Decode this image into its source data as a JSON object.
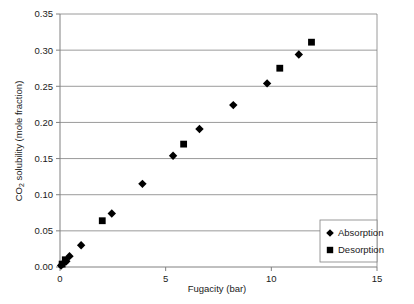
{
  "chart_data": {
    "type": "scatter",
    "title": "",
    "xlabel": "Fugacity (bar)",
    "ylabel": "CO2 solubility (mole fraction)",
    "ylabel_prefix": "CO",
    "ylabel_subscript": "2",
    "ylabel_suffix": " solubility (mole fraction)",
    "xlim": [
      0,
      15
    ],
    "ylim": [
      0,
      0.35
    ],
    "xticks": [
      0,
      5,
      10,
      15
    ],
    "xtick_labels": [
      "0",
      "5",
      "10",
      "15"
    ],
    "yticks": [
      0.0,
      0.05,
      0.1,
      0.15,
      0.2,
      0.25,
      0.3,
      0.35
    ],
    "ytick_labels": [
      "0.00",
      "0.05",
      "0.10",
      "0.15",
      "0.20",
      "0.25",
      "0.30",
      "0.35"
    ],
    "grid": "horizontal",
    "legend_position": "bottom-right",
    "marker_color": "#000000",
    "axis_color": "#808080",
    "grid_color": "#808080",
    "series": [
      {
        "name": "Absorption",
        "marker": "diamond",
        "color": "#000000",
        "points": [
          {
            "x": 0.05,
            "y": 0.002
          },
          {
            "x": 0.15,
            "y": 0.005
          },
          {
            "x": 0.3,
            "y": 0.008
          },
          {
            "x": 0.45,
            "y": 0.015
          },
          {
            "x": 1.0,
            "y": 0.03
          },
          {
            "x": 2.45,
            "y": 0.074
          },
          {
            "x": 3.9,
            "y": 0.115
          },
          {
            "x": 5.35,
            "y": 0.154
          },
          {
            "x": 6.6,
            "y": 0.191
          },
          {
            "x": 8.2,
            "y": 0.224
          },
          {
            "x": 9.8,
            "y": 0.254
          },
          {
            "x": 11.3,
            "y": 0.294
          }
        ]
      },
      {
        "name": "Desorption",
        "marker": "square",
        "color": "#000000",
        "points": [
          {
            "x": 0.1,
            "y": 0.004
          },
          {
            "x": 0.25,
            "y": 0.01
          },
          {
            "x": 2.0,
            "y": 0.064
          },
          {
            "x": 5.85,
            "y": 0.17
          },
          {
            "x": 10.4,
            "y": 0.275
          },
          {
            "x": 11.9,
            "y": 0.311
          }
        ]
      }
    ],
    "legend": [
      {
        "label": "Absorption",
        "marker": "diamond"
      },
      {
        "label": "Desorption",
        "marker": "square"
      }
    ]
  }
}
